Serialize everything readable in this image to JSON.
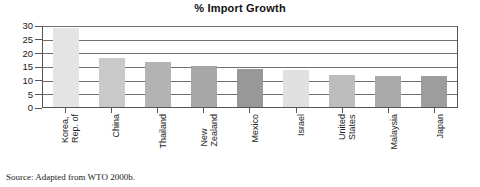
{
  "chart_data": {
    "type": "bar",
    "title": "% Import Growth",
    "xlabel": "",
    "ylabel": "",
    "ylim": [
      0,
      30
    ],
    "yticks": [
      "0",
      "5",
      "10",
      "15",
      "20",
      "25",
      "30"
    ],
    "grid": "horizontal",
    "legend": "none",
    "categories": [
      "Korea, Rep. of",
      "China",
      "Thailand",
      "New Zealand",
      "Mexico",
      "Israel",
      "United States",
      "Malaysia",
      "Japan"
    ],
    "category_lines": [
      [
        "Korea,",
        "Rep. of"
      ],
      [
        "China"
      ],
      [
        "Thailand"
      ],
      [
        "New",
        "Zealand"
      ],
      [
        "Mexico"
      ],
      [
        "Israel"
      ],
      [
        "United",
        "States"
      ],
      [
        "Malaysia"
      ],
      [
        "Japan"
      ]
    ],
    "values": [
      29,
      18,
      16.5,
      15,
      14,
      13.5,
      11.8,
      11.5,
      11.3
    ],
    "bar_colors": [
      "#e4e4e4",
      "#c9c9c9",
      "#b3b3b3",
      "#a7a7a7",
      "#989898",
      "#e0e0e0",
      "#bdbdbd",
      "#aaaaaa",
      "#9d9d9d"
    ]
  },
  "source": {
    "text": "Source: Adapted from WTO 2000b."
  },
  "colors": {
    "gridline": "#6f6f6f",
    "axis": "#555555",
    "text": "#1a1a1a"
  }
}
